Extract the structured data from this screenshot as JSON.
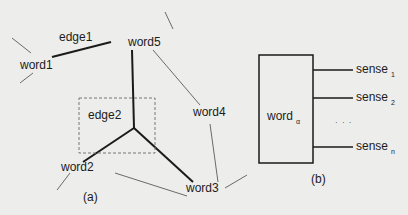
{
  "panel_a": {
    "caption": "(a)",
    "nodes": {
      "word1": "word1",
      "word2": "word2",
      "word3": "word3",
      "word4": "word4",
      "word5": "word5"
    },
    "edges": {
      "edge1": "edge1",
      "edge2": "edge2"
    }
  },
  "panel_b": {
    "caption": "(b)",
    "word": "word",
    "word_sub": "α",
    "senses": [
      {
        "label": "sense",
        "sub": "1"
      },
      {
        "label": "sense",
        "sub": "2"
      },
      {
        "label": "sense",
        "sub": "n"
      }
    ],
    "ellipsis": "· · ·"
  },
  "colors": {
    "background": "#ededeb",
    "thick_line": "#1a1a1a",
    "thin_line": "#6a6a6a",
    "dashed_box": "#777777"
  }
}
